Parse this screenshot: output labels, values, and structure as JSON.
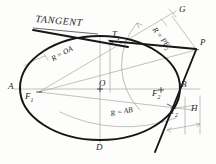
{
  "drawing": {
    "title_word": "TANGENT",
    "description": "Geometric construction of tangents to an ellipse from an external point",
    "ink_color": "#1a1a1a",
    "construction_color": "#8a8a8a",
    "paper_color": "#fdfdfb"
  },
  "labels": {
    "tangent": "TANGENT",
    "point_A": "A",
    "point_B": "B",
    "point_D": "D",
    "point_G": "G",
    "point_H": "H",
    "point_O": "O",
    "point_P": "P",
    "focus_1": "F",
    "focus_1_sub": "1",
    "focus_2": "F",
    "focus_2_sub": "2",
    "tangent_point_1": "T",
    "tangent_point_1_sub": "1",
    "tangent_point_2": "T",
    "tangent_point_2_sub": "2",
    "radius_oa": "R = OA",
    "radius_ab": "R = AB",
    "radius_pf2": "R = PF",
    "radius_pf2_sub": "2"
  },
  "geometry": {
    "ellipse": {
      "cx": 100,
      "cy": 88,
      "rx": 80,
      "ry": 52
    },
    "major_axis": {
      "x1": 20,
      "y1": 88,
      "x2": 180,
      "y2": 88
    },
    "minor_axis": {
      "x1": 100,
      "y1": 36,
      "x2": 100,
      "y2": 140
    },
    "focus_1": {
      "x": 39,
      "y": 92
    },
    "focus_2": {
      "x": 161,
      "y": 92
    },
    "point_P": {
      "x": 196,
      "y": 49
    },
    "point_G": {
      "x": 174,
      "y": 13
    },
    "point_T1": {
      "x": 110,
      "y": 40
    },
    "point_T2": {
      "x": 170,
      "y": 106
    },
    "arc_r_oa_radius": 80,
    "arc_r_ab_radius": 160,
    "arc_r_pf2_radius": 62
  }
}
